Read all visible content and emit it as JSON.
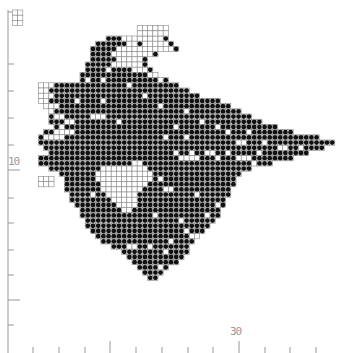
{
  "axes": {
    "y_label": "10",
    "x_label": "30",
    "y_label_pos": [
      8,
      163
    ],
    "x_label_pos": [
      230,
      339
    ],
    "y_axis_x": 8,
    "y_axis_top": 10,
    "y_axis_bottom": 353,
    "y_ticks": [
      12,
      64,
      91,
      118,
      145,
      170,
      198,
      223,
      250,
      275,
      300,
      325
    ],
    "y_tick_long": [
      12,
      170,
      300
    ],
    "x_axis_y": 353,
    "x_ticks": [
      33,
      59,
      85,
      110,
      136,
      162,
      188,
      213,
      239,
      265,
      290,
      316
    ],
    "x_tick_long": [
      110,
      239
    ]
  },
  "grid": {
    "origin_x": 28,
    "origin_y": 36,
    "cell": 5.2,
    "colors": {
      "line": "#888888",
      "dot": "#111111",
      "empty": "#ffffff"
    }
  },
  "rows": [
    [
      15,
      26
    ],
    [
      13,
      27
    ],
    [
      12,
      28
    ],
    [
      12,
      24
    ],
    [
      12,
      22
    ],
    [
      11,
      22
    ],
    [
      11,
      23
    ],
    [
      10,
      24
    ],
    [
      10,
      26
    ],
    [
      2,
      28
    ],
    [
      2,
      30
    ],
    [
      2,
      32
    ],
    [
      2,
      36
    ],
    [
      3,
      38
    ],
    [
      4,
      40
    ],
    [
      4,
      42
    ],
    [
      4,
      44
    ],
    [
      5,
      47
    ],
    [
      3,
      50
    ],
    [
      2,
      55
    ],
    [
      2,
      58
    ],
    [
      3,
      56
    ],
    [
      4,
      53
    ],
    [
      2,
      50
    ],
    [
      2,
      46
    ],
    [
      4,
      42
    ],
    [
      6,
      40
    ],
    [
      7,
      39
    ],
    [
      7,
      39
    ],
    [
      7,
      38
    ],
    [
      8,
      38
    ],
    [
      8,
      37
    ],
    [
      9,
      37
    ],
    [
      10,
      36
    ],
    [
      10,
      36
    ],
    [
      11,
      35
    ],
    [
      11,
      34
    ],
    [
      12,
      33
    ],
    [
      13,
      32
    ],
    [
      14,
      31
    ],
    [
      16,
      30
    ],
    [
      18,
      30
    ],
    [
      19,
      29
    ],
    [
      20,
      28
    ],
    [
      21,
      26
    ],
    [
      22,
      25
    ],
    [
      23,
      24
    ]
  ],
  "white_cells": [
    [
      2,
      9
    ],
    [
      3,
      9
    ],
    [
      4,
      9
    ],
    [
      2,
      10
    ],
    [
      3,
      10
    ],
    [
      2,
      11
    ],
    [
      3,
      11
    ],
    [
      4,
      11
    ],
    [
      2,
      12
    ],
    [
      3,
      12
    ],
    [
      3,
      13
    ],
    [
      4,
      13
    ],
    [
      5,
      13
    ],
    [
      3,
      14
    ],
    [
      4,
      14
    ],
    [
      5,
      15
    ],
    [
      6,
      15
    ],
    [
      7,
      16
    ],
    [
      8,
      16
    ],
    [
      6,
      17
    ],
    [
      5,
      18
    ],
    [
      6,
      18
    ],
    [
      7,
      18
    ],
    [
      8,
      18
    ],
    [
      3,
      19
    ],
    [
      4,
      19
    ],
    [
      5,
      19
    ],
    [
      6,
      19
    ],
    [
      18,
      0
    ],
    [
      19,
      0
    ],
    [
      20,
      0
    ],
    [
      21,
      0
    ],
    [
      22,
      0
    ],
    [
      23,
      0
    ],
    [
      24,
      0
    ],
    [
      25,
      0
    ],
    [
      19,
      1
    ],
    [
      20,
      1
    ],
    [
      22,
      1
    ],
    [
      23,
      1
    ],
    [
      24,
      1
    ],
    [
      25,
      1
    ],
    [
      26,
      1
    ],
    [
      17,
      2
    ],
    [
      18,
      2
    ],
    [
      19,
      2
    ],
    [
      20,
      2
    ],
    [
      21,
      2
    ],
    [
      22,
      2
    ],
    [
      23,
      2
    ],
    [
      24,
      2
    ],
    [
      25,
      2
    ],
    [
      26,
      2
    ],
    [
      27,
      2
    ],
    [
      16,
      3
    ],
    [
      17,
      3
    ],
    [
      18,
      3
    ],
    [
      19,
      3
    ],
    [
      20,
      3
    ],
    [
      21,
      3
    ],
    [
      22,
      3
    ],
    [
      23,
      3
    ],
    [
      17,
      4
    ],
    [
      18,
      4
    ],
    [
      19,
      4
    ],
    [
      20,
      4
    ],
    [
      21,
      4
    ],
    [
      16,
      5
    ],
    [
      17,
      5
    ],
    [
      18,
      5
    ],
    [
      19,
      5
    ],
    [
      20,
      5
    ],
    [
      21,
      5
    ],
    [
      20,
      6
    ],
    [
      21,
      6
    ],
    [
      22,
      6
    ],
    [
      23,
      7
    ],
    [
      24,
      7
    ],
    [
      25,
      8
    ],
    [
      15,
      6
    ],
    [
      14,
      8
    ],
    [
      11,
      8
    ],
    [
      19,
      9
    ],
    [
      22,
      11
    ],
    [
      9,
      12
    ],
    [
      14,
      12
    ],
    [
      25,
      13
    ],
    [
      30,
      14
    ],
    [
      12,
      15
    ],
    [
      13,
      15
    ],
    [
      14,
      15
    ],
    [
      17,
      16
    ],
    [
      33,
      16
    ],
    [
      28,
      17
    ],
    [
      36,
      17
    ],
    [
      38,
      18
    ],
    [
      42,
      18
    ],
    [
      26,
      19
    ],
    [
      30,
      19
    ],
    [
      40,
      20
    ],
    [
      41,
      20
    ],
    [
      45,
      20
    ],
    [
      48,
      21
    ],
    [
      49,
      21
    ],
    [
      52,
      21
    ],
    [
      28,
      22
    ],
    [
      31,
      22
    ],
    [
      34,
      22
    ],
    [
      35,
      22
    ],
    [
      38,
      22
    ],
    [
      44,
      22
    ],
    [
      29,
      23
    ],
    [
      30,
      23
    ],
    [
      31,
      23
    ],
    [
      32,
      23
    ],
    [
      36,
      23
    ],
    [
      40,
      23
    ],
    [
      41,
      23
    ],
    [
      42,
      23
    ],
    [
      20,
      24
    ],
    [
      21,
      24
    ],
    [
      43,
      24
    ],
    [
      14,
      25
    ],
    [
      15,
      25
    ],
    [
      16,
      25
    ],
    [
      17,
      25
    ],
    [
      18,
      25
    ],
    [
      19,
      25
    ],
    [
      20,
      25
    ],
    [
      21,
      25
    ],
    [
      22,
      25
    ],
    [
      13,
      26
    ],
    [
      14,
      26
    ],
    [
      15,
      26
    ],
    [
      16,
      26
    ],
    [
      17,
      26
    ],
    [
      18,
      26
    ],
    [
      19,
      26
    ],
    [
      20,
      26
    ],
    [
      21,
      26
    ],
    [
      22,
      26
    ],
    [
      23,
      26
    ],
    [
      13,
      27
    ],
    [
      14,
      27
    ],
    [
      15,
      27
    ],
    [
      16,
      27
    ],
    [
      17,
      27
    ],
    [
      18,
      27
    ],
    [
      19,
      27
    ],
    [
      20,
      27
    ],
    [
      21,
      27
    ],
    [
      22,
      27
    ],
    [
      23,
      27
    ],
    [
      14,
      28
    ],
    [
      15,
      28
    ],
    [
      16,
      28
    ],
    [
      17,
      28
    ],
    [
      18,
      28
    ],
    [
      19,
      28
    ],
    [
      20,
      28
    ],
    [
      21,
      28
    ],
    [
      22,
      28
    ],
    [
      14,
      29
    ],
    [
      15,
      29
    ],
    [
      16,
      29
    ],
    [
      17,
      29
    ],
    [
      18,
      29
    ],
    [
      19,
      29
    ],
    [
      20,
      29
    ],
    [
      21,
      29
    ],
    [
      15,
      30
    ],
    [
      16,
      30
    ],
    [
      17,
      30
    ],
    [
      18,
      30
    ],
    [
      19,
      30
    ],
    [
      20,
      30
    ],
    [
      16,
      31
    ],
    [
      17,
      31
    ],
    [
      18,
      31
    ],
    [
      19,
      31
    ],
    [
      20,
      31
    ],
    [
      17,
      32
    ],
    [
      18,
      32
    ],
    [
      19,
      32
    ],
    [
      20,
      32
    ],
    [
      18,
      33
    ],
    [
      19,
      33
    ],
    [
      25,
      27
    ],
    [
      27,
      29
    ],
    [
      32,
      30
    ],
    [
      24,
      34
    ],
    [
      29,
      35
    ],
    [
      31,
      38
    ],
    [
      32,
      38
    ],
    [
      27,
      39
    ],
    [
      23,
      40
    ],
    [
      19,
      40
    ],
    [
      20,
      40
    ],
    [
      26,
      41
    ],
    [
      25,
      44
    ],
    [
      26,
      29
    ],
    [
      12,
      30
    ],
    [
      30,
      37
    ],
    [
      36,
      32
    ],
    [
      34,
      34
    ],
    [
      10,
      44
    ],
    [
      11,
      44
    ],
    [
      12,
      44
    ],
    [
      14,
      45
    ],
    [
      15,
      45
    ],
    [
      16,
      45
    ]
  ],
  "outliers": [
    {
      "col": -3,
      "row": -5,
      "w": 2,
      "h": 3
    },
    {
      "col": 21,
      "row": -2,
      "w": 6,
      "h": 2
    },
    {
      "col": 2,
      "row": 27,
      "w": 3,
      "h": 2
    }
  ]
}
